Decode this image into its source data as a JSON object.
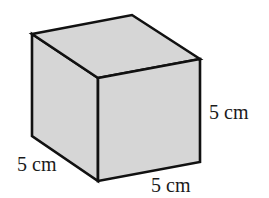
{
  "figure": {
    "type": "cube",
    "fill_color": "#d6d6d6",
    "stroke_color": "#111111",
    "edge_length": 5,
    "unit": "cm"
  },
  "labels": {
    "height": "5 cm",
    "width": "5 cm",
    "depth": "5 cm"
  }
}
